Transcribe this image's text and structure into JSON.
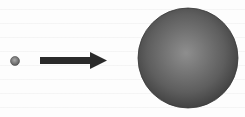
{
  "diagram": {
    "title": "",
    "nodes": [
      {
        "id": "small-circle",
        "label": "",
        "shape": "circle",
        "relative_size": "small",
        "fill": "#6e6e6e",
        "highlight": "#a0a0a0"
      },
      {
        "id": "large-sphere",
        "label": "",
        "shape": "circle",
        "relative_size": "large",
        "fill": "#4a4a4a",
        "highlight": "#8a8a8a"
      }
    ],
    "edges": [
      {
        "from": "small-circle",
        "to": "large-sphere",
        "type": "arrow",
        "color": "#2a2a2a",
        "label": ""
      }
    ],
    "colors": {
      "background": "#fdfdfd",
      "arrow": "#2a2a2a",
      "sphere_dark": "#3e3e3e",
      "sphere_light": "#8c8c8c"
    }
  }
}
